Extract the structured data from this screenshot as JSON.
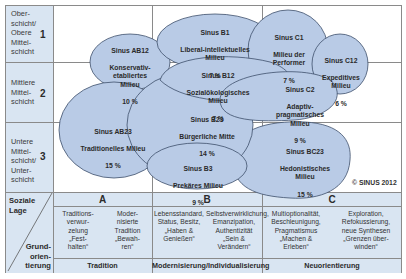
{
  "diagram": {
    "copyright": "© SINUS 2012",
    "rows": [
      {
        "label": "Ober-\nschicht/\nObere\nMittel-\nschicht",
        "number": "1"
      },
      {
        "label": "Mittlere\nMittel-\nschicht",
        "number": "2"
      },
      {
        "label": "Untere\nMittel-\nschicht/\nUnter-\nschicht",
        "number": "3"
      }
    ],
    "corner": {
      "top": "Soziale\nLage",
      "bottom": "Grund-\norien-\ntierung"
    },
    "columns": [
      {
        "letter": "A",
        "footer": "Tradition",
        "descriptions": [
          "Traditions-\nverwur-\nzelung\n„Fest-\nhalten“",
          "Moder-\nnisierte\nTradition\n„Bewah-\nren“"
        ]
      },
      {
        "letter": "B",
        "footer": "Modernisierung/Individualisierung",
        "descriptions": [
          "Lebensstandard,\nStatus, Besitz,\n„Haben & Genießen“",
          "Selbstverwirklichung,\nEmanzipation,\nAuthentizität\n„Sein & Verändern“"
        ]
      },
      {
        "letter": "C",
        "footer": "Neuorientierung",
        "descriptions": [
          "Multioptionalität,\nBeschleunigung,\nPragmatismus\n„Machen &\nErleben“",
          "Exploration,\nRefokussierung,\nneue Synthesen\n„Grenzen über-\nwinden“"
        ]
      }
    ],
    "milieus": [
      {
        "code": "Sinus AB12",
        "name": "Konservativ-\netabliertes\nMilieu",
        "share": "10 %"
      },
      {
        "code": "Sinus B1",
        "name": "Liberal-intellektuelles\nMilieu",
        "share": "7 %"
      },
      {
        "code": "Sinus C1",
        "name": "Milieu der\nPerformer",
        "share": "7 %"
      },
      {
        "code": "Sinus C12",
        "name": "Expeditives\nMilieu",
        "share": "6 %"
      },
      {
        "code": "Sinus B12",
        "name": "Sozialökologisches\nMilieu",
        "share": "7 %"
      },
      {
        "code": "Sinus C2",
        "name": "Adaptiv-\npragmatisches\nMilieu",
        "share": "9 %"
      },
      {
        "code": "Sinus AB23",
        "name": "Traditionelles Milieu",
        "share": "15 %"
      },
      {
        "code": "Sinus B23",
        "name": "Bürgerliche Mitte",
        "share": "14 %"
      },
      {
        "code": "Sinus BC23",
        "name": "Hedonistisches\nMilieu",
        "share": "15 %"
      },
      {
        "code": "Sinus B3",
        "name": "Prekäres Milieu",
        "share": "9 %"
      }
    ],
    "colors": {
      "bubble_fill": "#b9cbe6",
      "bubble_stroke": "#3d4f6b",
      "label_bg": "#d9e5f2",
      "grid": "#8a8a8a"
    }
  }
}
